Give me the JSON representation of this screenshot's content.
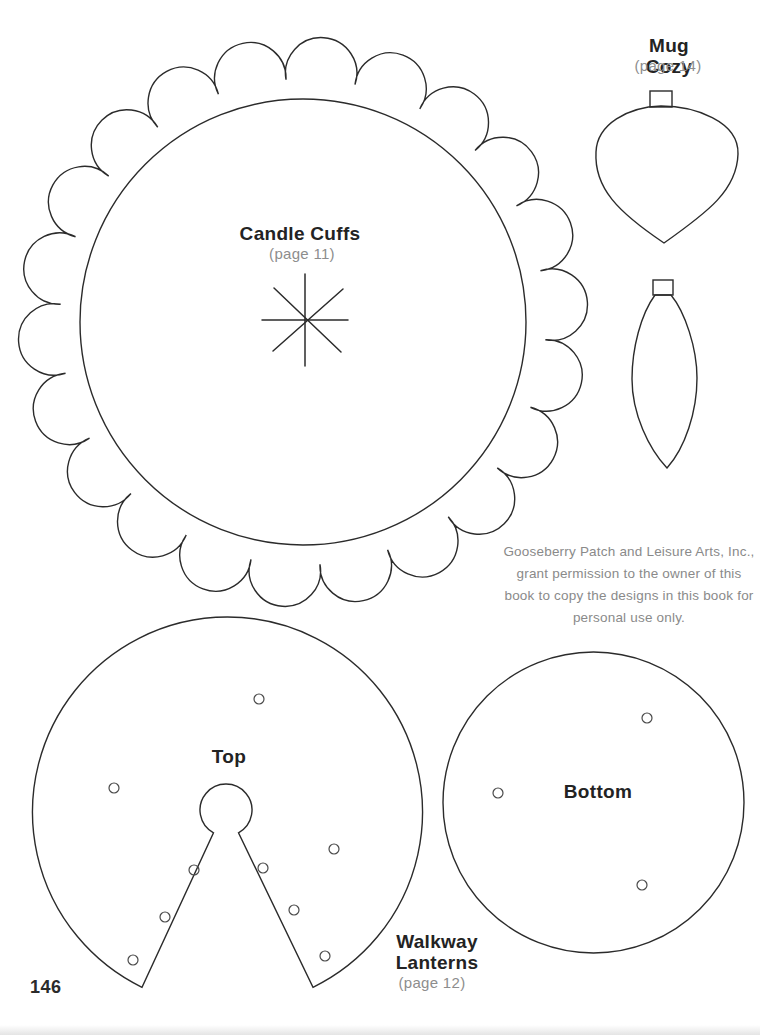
{
  "page": {
    "number": "146",
    "ink_color": "#2b2b2b",
    "muted_color": "#8a8a8a"
  },
  "candle_cuffs": {
    "title": "Candle Cuffs",
    "page_ref": "(page 11)"
  },
  "mug_cozy": {
    "title": "Mug Cozy",
    "page_ref": "(page 14)"
  },
  "walkway_lanterns": {
    "title": "Walkway\nLanterns",
    "page_ref": "(page 12)",
    "top_label": "Top",
    "bottom_label": "Bottom"
  },
  "permission_notice": {
    "text": "Gooseberry Patch and Leisure Arts, Inc.,\ngrant permission to the owner of this\nbook to copy the designs in this book for\npersonal use only."
  }
}
